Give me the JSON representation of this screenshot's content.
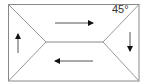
{
  "diagram": {
    "type": "hip-roof-plan",
    "angle_label": "45°",
    "colors": {
      "outline": "#888888",
      "arrow": "#111111",
      "background": "#ffffff"
    },
    "outline": {
      "x1": 8,
      "y1": 4,
      "x2": 139,
      "y2": 81
    },
    "ridge": {
      "x1": 46,
      "y1": 42,
      "x2": 103,
      "y2": 42
    },
    "arrows": [
      {
        "name": "arrow-right",
        "direction": "right",
        "x1": 55,
        "y1": 23,
        "x2": 93,
        "y2": 23
      },
      {
        "name": "arrow-down",
        "direction": "down",
        "x1": 130,
        "y1": 32,
        "x2": 130,
        "y2": 51
      },
      {
        "name": "arrow-left",
        "direction": "left",
        "x1": 93,
        "y1": 61,
        "x2": 55,
        "y2": 61
      },
      {
        "name": "arrow-up",
        "direction": "up",
        "x1": 18,
        "y1": 53,
        "x2": 18,
        "y2": 34
      }
    ]
  }
}
